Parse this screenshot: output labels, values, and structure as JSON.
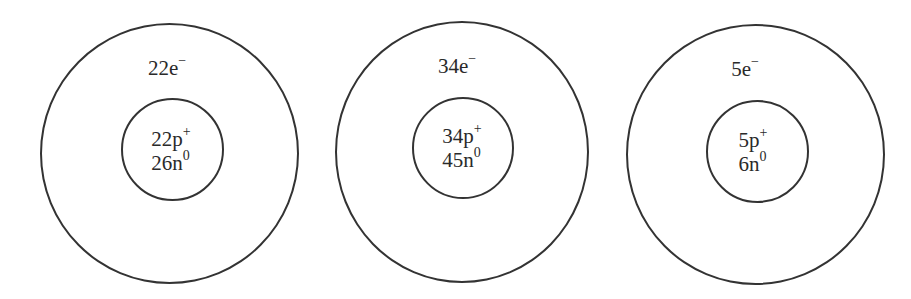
{
  "diagram": {
    "type": "atomic-structure-models",
    "stroke_color": "#333333",
    "atoms": [
      {
        "electrons": {
          "count": "22",
          "symbol": "e",
          "charge": "−"
        },
        "protons": {
          "count": "22",
          "symbol": "p",
          "charge": "+"
        },
        "neutrons": {
          "count": "26",
          "symbol": "n",
          "charge": "0"
        }
      },
      {
        "electrons": {
          "count": "34",
          "symbol": "e",
          "charge": "−"
        },
        "protons": {
          "count": "34",
          "symbol": "p",
          "charge": "+"
        },
        "neutrons": {
          "count": "45",
          "symbol": "n",
          "charge": "0"
        }
      },
      {
        "electrons": {
          "count": "5",
          "symbol": "e",
          "charge": "−"
        },
        "protons": {
          "count": "5",
          "symbol": "p",
          "charge": "+"
        },
        "neutrons": {
          "count": "6",
          "symbol": "n",
          "charge": "0"
        }
      }
    ]
  }
}
